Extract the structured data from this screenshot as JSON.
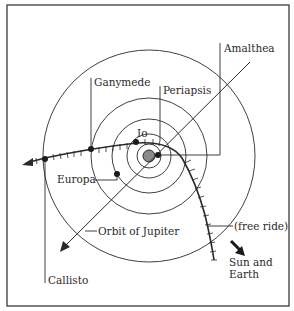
{
  "diagram": {
    "title": "",
    "center": "Jupiter",
    "labels": {
      "amalthea": "Amalthea",
      "ganymede": "Ganymede",
      "periapsis": "Periapsis",
      "io": "Io",
      "europa": "Europa",
      "orbit_of_jupiter": "Orbit of Jupiter",
      "free_ride": "(free ride)",
      "sun_and": "Sun and",
      "earth": "Earth",
      "callisto": "Callisto"
    },
    "orbits": [
      "Amalthea",
      "Io",
      "Europa",
      "Ganymede",
      "Callisto"
    ],
    "colors": {
      "line": "#2a2a2a",
      "planet": "#8a8a8a",
      "background": "#ffffff"
    }
  }
}
